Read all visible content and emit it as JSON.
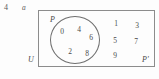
{
  "question": {
    "number": "4",
    "part": "a"
  },
  "diagram": {
    "type": "venn",
    "universe_label": "U",
    "set_label": "P",
    "complement_label": "P'",
    "inside_set": [
      {
        "value": "0",
        "x": 58,
        "y": 28
      },
      {
        "value": "4",
        "x": 75,
        "y": 26
      },
      {
        "value": "6",
        "x": 87,
        "y": 34
      },
      {
        "value": "2",
        "x": 66,
        "y": 48
      },
      {
        "value": "8",
        "x": 83,
        "y": 50
      }
    ],
    "outside_set": [
      {
        "value": "1",
        "x": 112,
        "y": 20
      },
      {
        "value": "3",
        "x": 133,
        "y": 22
      },
      {
        "value": "5",
        "x": 111,
        "y": 37
      },
      {
        "value": "7",
        "x": 132,
        "y": 38
      },
      {
        "value": "9",
        "x": 111,
        "y": 52
      }
    ],
    "colors": {
      "rect_stroke": "#8c8c8c",
      "circle_stroke": "#6f6f6f",
      "text": "#4a4a4a",
      "background": "#fdfdfd"
    }
  }
}
